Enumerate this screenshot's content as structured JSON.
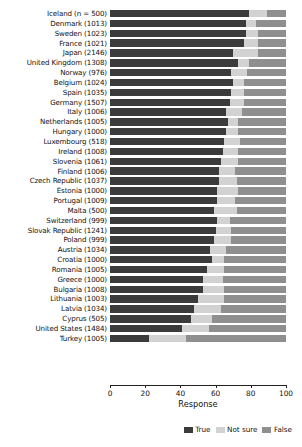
{
  "chart_data": {
    "type": "bar",
    "subtype": "stacked-horizontal-bar",
    "title": "",
    "xlabel": "Response",
    "ylabel": "",
    "xlim": [
      0,
      100
    ],
    "xticks": [
      0,
      20,
      40,
      60,
      80,
      100
    ],
    "grid": false,
    "legend_position": "bottom-right",
    "legend": [
      "True",
      "Not sure",
      "False"
    ],
    "series": [
      {
        "name": "True",
        "color": "#3b3b3b"
      },
      {
        "name": "Not sure",
        "color": "#d2d2d2"
      },
      {
        "name": "False",
        "color": "#8f8f8f"
      }
    ],
    "categories": [
      "Iceland (n = 500)",
      "Denmark (1013)",
      "Sweden (1023)",
      "France (1021)",
      "Japan (2146)",
      "United Kingdom (1308)",
      "Norway (976)",
      "Belgium (1024)",
      "Spain (1035)",
      "Germany (1507)",
      "Italy (1006)",
      "Netherlands (1005)",
      "Hungary (1000)",
      "Luxembourg (518)",
      "Ireland (1008)",
      "Slovenia (1061)",
      "Finland (1006)",
      "Czech Republic (1037)",
      "Estonia (1000)",
      "Portugal (1009)",
      "Malta (500)",
      "Switzerland (999)",
      "Slovak Republic (1241)",
      "Poland (999)",
      "Austria (1034)",
      "Croatia (1000)",
      "Romania (1005)",
      "Greece (1000)",
      "Bulgaria (1008)",
      "Lithuania (1003)",
      "Latvia (1034)",
      "Cyprus (505)",
      "United States (1484)",
      "Turkey (1005)"
    ],
    "rows": [
      {
        "category": "Iceland (n = 500)",
        "True": 79,
        "Not sure": 10,
        "False": 11
      },
      {
        "category": "Denmark (1013)",
        "True": 77,
        "Not sure": 6,
        "False": 17
      },
      {
        "category": "Sweden (1023)",
        "True": 77,
        "Not sure": 7,
        "False": 16
      },
      {
        "category": "France (1021)",
        "True": 76,
        "Not sure": 8,
        "False": 16
      },
      {
        "category": "Japan (2146)",
        "True": 70,
        "Not sure": 14,
        "False": 16
      },
      {
        "category": "United Kingdom (1308)",
        "True": 73,
        "Not sure": 6,
        "False": 21
      },
      {
        "category": "Norway (976)",
        "True": 69,
        "Not sure": 9,
        "False": 22
      },
      {
        "category": "Belgium (1024)",
        "True": 70,
        "Not sure": 6,
        "False": 24
      },
      {
        "category": "Spain (1035)",
        "True": 69,
        "Not sure": 7,
        "False": 24
      },
      {
        "category": "Germany (1507)",
        "True": 68,
        "Not sure": 8,
        "False": 24
      },
      {
        "category": "Italy (1006)",
        "True": 66,
        "Not sure": 9,
        "False": 25
      },
      {
        "category": "Netherlands (1005)",
        "True": 67,
        "Not sure": 6,
        "False": 27
      },
      {
        "category": "Hungary (1000)",
        "True": 66,
        "Not sure": 7,
        "False": 27
      },
      {
        "category": "Luxembourg (518)",
        "True": 65,
        "Not sure": 9,
        "False": 26
      },
      {
        "category": "Ireland (1008)",
        "True": 64,
        "Not sure": 9,
        "False": 27
      },
      {
        "category": "Slovenia (1061)",
        "True": 63,
        "Not sure": 10,
        "False": 27
      },
      {
        "category": "Finland (1006)",
        "True": 62,
        "Not sure": 9,
        "False": 29
      },
      {
        "category": "Czech Republic (1037)",
        "True": 62,
        "Not sure": 10,
        "False": 28
      },
      {
        "category": "Estonia (1000)",
        "True": 61,
        "Not sure": 12,
        "False": 27
      },
      {
        "category": "Portugal (1009)",
        "True": 61,
        "Not sure": 10,
        "False": 29
      },
      {
        "category": "Malta (500)",
        "True": 59,
        "Not sure": 13,
        "False": 28
      },
      {
        "category": "Switzerland (999)",
        "True": 61,
        "Not sure": 7,
        "False": 32
      },
      {
        "category": "Slovak Republic (1241)",
        "True": 60,
        "Not sure": 9,
        "False": 31
      },
      {
        "category": "Poland (999)",
        "True": 59,
        "Not sure": 10,
        "False": 31
      },
      {
        "category": "Austria (1034)",
        "True": 57,
        "Not sure": 9,
        "False": 34
      },
      {
        "category": "Croatia (1000)",
        "True": 58,
        "Not sure": 7,
        "False": 35
      },
      {
        "category": "Romania (1005)",
        "True": 55,
        "Not sure": 10,
        "False": 35
      },
      {
        "category": "Greece (1000)",
        "True": 53,
        "Not sure": 11,
        "False": 36
      },
      {
        "category": "Bulgaria (1008)",
        "True": 53,
        "Not sure": 12,
        "False": 35
      },
      {
        "category": "Lithuania (1003)",
        "True": 50,
        "Not sure": 15,
        "False": 35
      },
      {
        "category": "Latvia (1034)",
        "True": 48,
        "Not sure": 15,
        "False": 37
      },
      {
        "category": "Cyprus (505)",
        "True": 46,
        "Not sure": 12,
        "False": 42
      },
      {
        "category": "United States (1484)",
        "True": 41,
        "Not sure": 15,
        "False": 44
      },
      {
        "category": "Turkey (1005)",
        "True": 22,
        "Not sure": 21,
        "False": 57
      }
    ]
  }
}
